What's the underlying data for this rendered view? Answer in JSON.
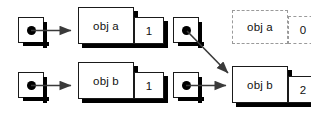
{
  "diagram": {
    "colors": {
      "stroke": "#1a1a1a",
      "shadow": "#000000",
      "dashed_stroke": "#9a9a9a",
      "background": "#ffffff",
      "text": "#111111"
    },
    "panels": [
      {
        "id": "before",
        "pointers": [
          {
            "name": "pointer-a",
            "target": "obj a"
          },
          {
            "name": "pointer-b",
            "target": "obj b"
          }
        ],
        "objects": [
          {
            "label": "obj a",
            "count": "1",
            "state": "live"
          },
          {
            "label": "obj b",
            "count": "1",
            "state": "live"
          }
        ]
      },
      {
        "id": "after",
        "pointers": [
          {
            "name": "pointer-a",
            "target": "obj b"
          },
          {
            "name": "pointer-b",
            "target": "obj b"
          }
        ],
        "objects": [
          {
            "label": "obj a",
            "count": "0",
            "state": "freed"
          },
          {
            "label": "obj b",
            "count": "2",
            "state": "live"
          }
        ]
      }
    ]
  }
}
